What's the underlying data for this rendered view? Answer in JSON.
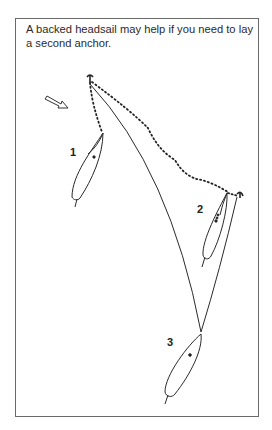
{
  "caption": "A backed headsail may help if you need to lay a second anchor.",
  "diagram": {
    "boats": [
      {
        "label": "1",
        "x": 72,
        "y": 155
      },
      {
        "label": "2",
        "x": 200,
        "y": 213
      },
      {
        "label": "3",
        "x": 170,
        "y": 345
      }
    ],
    "elements": [
      "wind-arrow",
      "first-anchor",
      "second-anchor",
      "anchor-rode-dotted",
      "anchor-rope-solid"
    ],
    "colors": {
      "line": "#2a2a2a",
      "frame": "#6a6a6a"
    }
  }
}
